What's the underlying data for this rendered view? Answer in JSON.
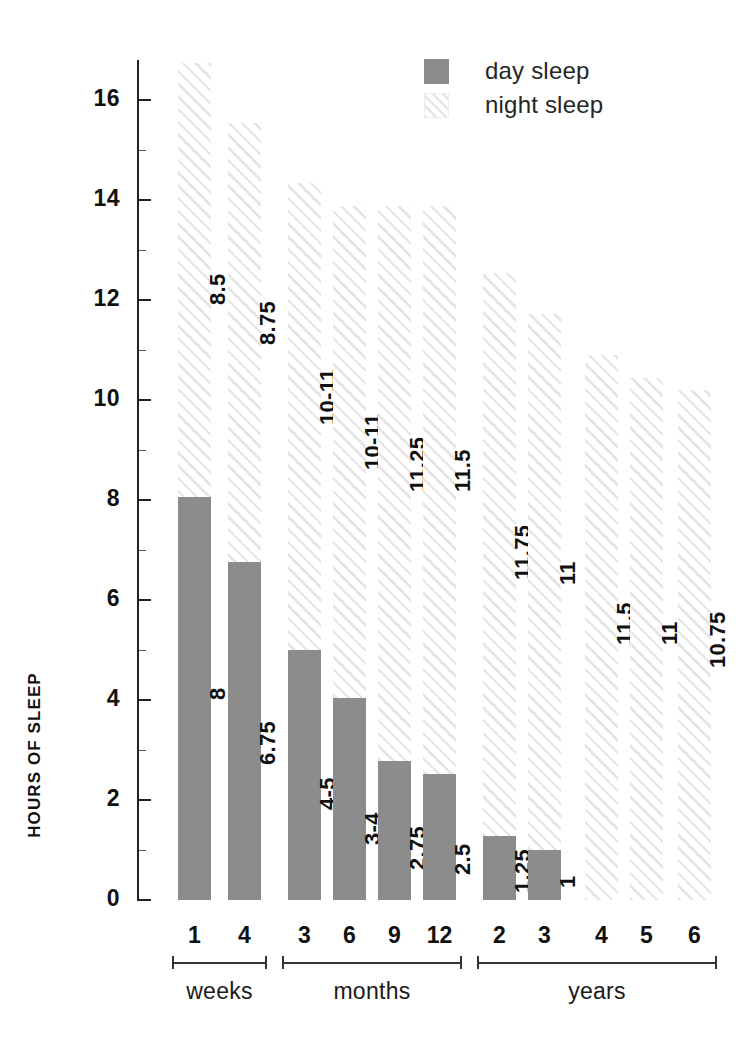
{
  "axis": {
    "y_title": "HOURS OF SLEEP",
    "y_ticks": [
      "0",
      "2",
      "4",
      "6",
      "8",
      "10",
      "12",
      "14",
      "16"
    ]
  },
  "legend": {
    "items": [
      {
        "label": "day sleep",
        "swatch": "solid-gray-swatch",
        "color": "#8c8c8c"
      },
      {
        "label": "night sleep",
        "swatch": "hatched-swatch",
        "color": "#e6e6e6"
      }
    ]
  },
  "groups": [
    {
      "name": "weeks",
      "ticks": [
        "1",
        "4"
      ]
    },
    {
      "name": "months",
      "ticks": [
        "3",
        "6",
        "9",
        "12"
      ]
    },
    {
      "name": "years",
      "ticks": [
        "2",
        "3",
        "4",
        "5",
        "6"
      ]
    }
  ],
  "chart_data": {
    "type": "bar",
    "xlabel": "",
    "ylabel": "HOURS OF SLEEP",
    "ylim": [
      0,
      16.8
    ],
    "grid": false,
    "legend_position": "top-right",
    "categories": [
      "1 week",
      "4 weeks",
      "3 months",
      "6 months",
      "9 months",
      "12 months",
      "2 years",
      "3 years",
      "4 years",
      "5 years",
      "6 years"
    ],
    "group_labels": [
      "weeks",
      "weeks",
      "months",
      "months",
      "months",
      "months",
      "years",
      "years",
      "years",
      "years",
      "years"
    ],
    "series": [
      {
        "name": "night sleep",
        "labels": [
          "8.5",
          "8.75",
          "10-11",
          "10-11",
          "11.25",
          "11.5",
          "11.75",
          "11",
          "11.5",
          "11",
          "10.75"
        ],
        "values": [
          8.5,
          8.75,
          10.5,
          10.5,
          11.25,
          11.5,
          11.75,
          11,
          11.5,
          11,
          10.75
        ],
        "bar_top_values": [
          16.8,
          15.6,
          14.4,
          13.9,
          13.9,
          13.9,
          13.5,
          12.5,
          11.6,
          11.2,
          11.0
        ]
      },
      {
        "name": "day sleep",
        "labels": [
          "8",
          "6.75",
          "4-5",
          "3-4",
          "2.75",
          "2.5",
          "1.25",
          "1",
          "",
          "",
          ""
        ],
        "values": [
          8,
          6.75,
          4.5,
          3.5,
          2.75,
          2.5,
          1.25,
          1,
          0,
          0,
          0
        ],
        "bar_top_values": [
          8.05,
          6.85,
          5.0,
          4.05,
          2.8,
          2.55,
          1.3,
          1.0,
          0,
          0,
          0
        ]
      }
    ]
  },
  "bars": [
    {
      "cat": "1",
      "group": "weeks",
      "x": 178,
      "night_top": 63,
      "day_top": 497,
      "night_label": "8.5",
      "day_label": "8",
      "night_label_y": 305,
      "day_label_y": 700
    },
    {
      "cat": "4",
      "group": "weeks",
      "x": 228,
      "night_top": 123,
      "day_top": 562,
      "night_label": "8.75",
      "day_label": "6.75",
      "night_label_y": 345,
      "day_label_y": 765
    },
    {
      "cat": "3",
      "group": "months",
      "x": 288,
      "night_top": 183,
      "day_top": 650,
      "night_label": "10-11",
      "day_label": "4-5",
      "night_label_y": 425,
      "day_label_y": 810
    },
    {
      "cat": "6",
      "group": "months",
      "x": 333,
      "night_top": 206,
      "day_top": 698,
      "night_label": "10-11",
      "day_label": "3-4",
      "night_label_y": 470,
      "day_label_y": 845
    },
    {
      "cat": "9",
      "group": "months",
      "x": 378,
      "night_top": 206,
      "day_top": 761,
      "night_label": "11.25",
      "day_label": "2.75",
      "night_label_y": 492,
      "day_label_y": 870
    },
    {
      "cat": "12",
      "group": "months",
      "x": 423,
      "night_top": 206,
      "day_top": 774,
      "night_label": "11.5",
      "day_label": "2.5",
      "night_label_y": 492,
      "day_label_y": 875
    },
    {
      "cat": "2",
      "group": "years",
      "x": 483,
      "night_top": 273,
      "day_top": 836,
      "night_label": "11.75",
      "day_label": "1.25",
      "night_label_y": 580,
      "day_label_y": 893
    },
    {
      "cat": "3",
      "group": "years",
      "x": 528,
      "night_top": 314,
      "day_top": 850,
      "night_label": "11",
      "day_label": "1",
      "night_label_y": 585,
      "day_label_y": 888
    },
    {
      "cat": "4",
      "group": "years",
      "x": 585,
      "night_top": 355,
      "day_top": null,
      "night_label": "11.5",
      "day_label": "",
      "night_label_y": 645,
      "day_label_y": 0
    },
    {
      "cat": "5",
      "group": "years",
      "x": 630,
      "night_top": 378,
      "day_top": null,
      "night_label": "11",
      "day_label": "",
      "night_label_y": 645,
      "day_label_y": 0
    },
    {
      "cat": "6",
      "group": "years",
      "x": 678,
      "night_top": 390,
      "day_top": null,
      "night_label": "10.75",
      "day_label": "",
      "night_label_y": 668,
      "day_label_y": 0
    }
  ]
}
